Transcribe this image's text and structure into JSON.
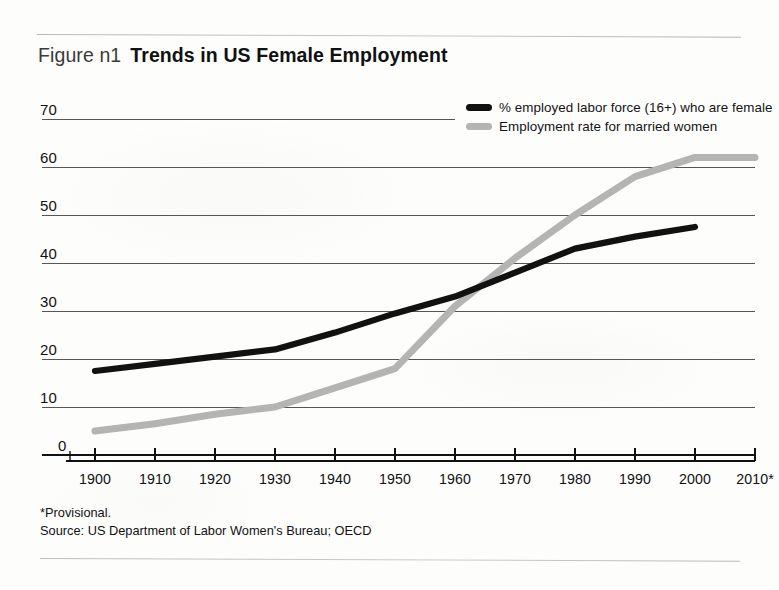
{
  "figure": {
    "label": "Figure n1",
    "title": "Trends in US Female Employment"
  },
  "footnotes": {
    "provisional": "*Provisional.",
    "source": "Source: US Department of Labor Women's Bureau; OECD"
  },
  "colors": {
    "series_black": "#111111",
    "series_gray": "#b4b4b4",
    "gridline": "#4d4d4d",
    "axis": "#111111",
    "rule": "#c2c2bf",
    "background": "#fdfdfc"
  },
  "chart_data": {
    "type": "line",
    "title": "Trends in US Female Employment",
    "xlabel": "",
    "ylabel": "",
    "x": [
      1900,
      1910,
      1920,
      1930,
      1940,
      1950,
      1960,
      1970,
      1980,
      1990,
      2000,
      2010
    ],
    "xtick_labels": [
      "1900",
      "1910",
      "1920",
      "1930",
      "1940",
      "1950",
      "1960",
      "1970",
      "1980",
      "1990",
      "2000",
      "2010*"
    ],
    "ytick_labels": [
      "0",
      "10",
      "20",
      "30",
      "40",
      "50",
      "60",
      "70"
    ],
    "yticks": [
      0,
      10,
      20,
      30,
      40,
      50,
      60,
      70
    ],
    "ylim": [
      0,
      70
    ],
    "xlim": [
      1900,
      2010
    ],
    "grid": true,
    "legend_position": "top-right",
    "series": [
      {
        "name": "% employed labor force (16+) who are female",
        "color": "#111111",
        "values": [
          17.5,
          19.0,
          20.5,
          22.0,
          25.5,
          29.5,
          33.0,
          38.0,
          43.0,
          45.5,
          47.5,
          null
        ]
      },
      {
        "name": "Employment rate for married women",
        "color": "#b4b4b4",
        "values": [
          5.0,
          6.5,
          8.5,
          10.0,
          14.0,
          18.0,
          31.0,
          41.0,
          50.0,
          58.0,
          62.0,
          62.0
        ]
      }
    ]
  }
}
